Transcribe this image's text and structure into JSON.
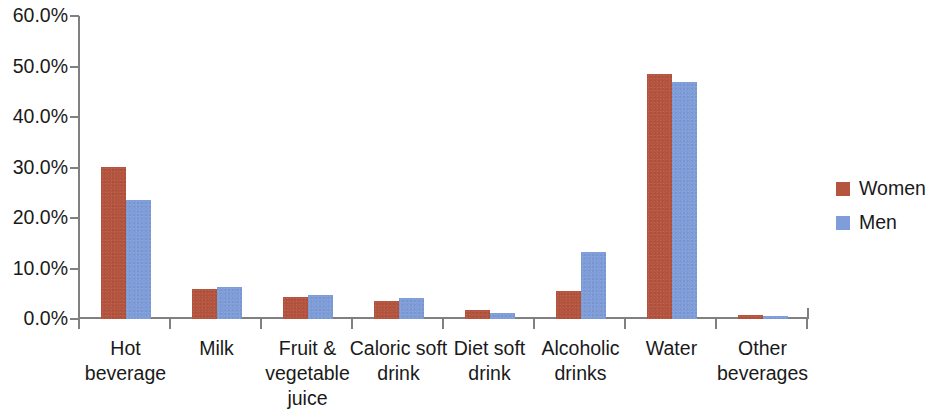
{
  "chart_data": {
    "type": "bar",
    "title": "",
    "subtitle": "",
    "xlabel": "",
    "ylabel": "",
    "ylim": [
      0,
      60
    ],
    "grid": false,
    "legend_position": "right",
    "ytick_labels": [
      "60.0%",
      "50.0%",
      "40.0%",
      "30.0%",
      "20.0%",
      "10.0%",
      "0.0%"
    ],
    "ytick_values": [
      60,
      50,
      40,
      30,
      20,
      10,
      0
    ],
    "categories": [
      "Hot beverage",
      "Milk",
      "Fruit & vegetable juice",
      "Caloric soft drink",
      "Diet soft drink",
      "Alcoholic drinks",
      "Water",
      "Other beverages"
    ],
    "series": [
      {
        "name": "Women",
        "color": "#b5553f",
        "values": [
          30.2,
          6.0,
          4.3,
          3.5,
          1.8,
          5.5,
          48.6,
          0.8
        ]
      },
      {
        "name": "Men",
        "color": "#7f9dd8",
        "values": [
          23.5,
          6.4,
          4.7,
          4.1,
          1.2,
          13.3,
          47.0,
          0.6
        ]
      }
    ]
  },
  "legend": {
    "items": [
      {
        "label": "Women",
        "color": "#b5553f"
      },
      {
        "label": "Men",
        "color": "#7f9dd8"
      }
    ]
  }
}
